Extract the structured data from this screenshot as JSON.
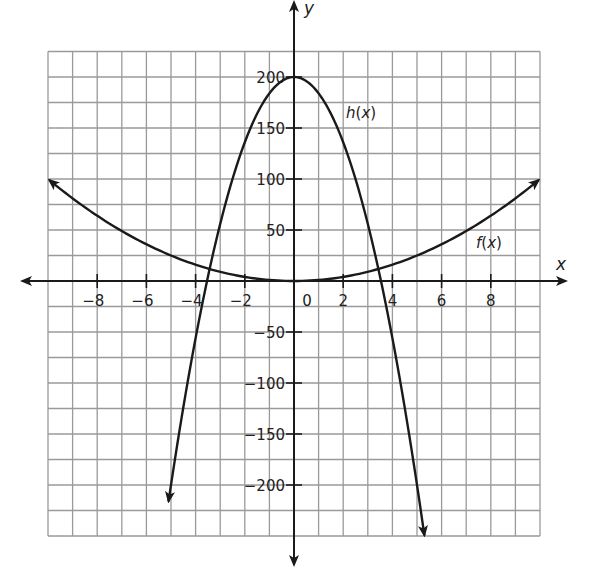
{
  "chart_data": {
    "type": "line",
    "title": "",
    "xlabel": "x",
    "ylabel": "y",
    "xlim": [
      -10,
      10
    ],
    "ylim": [
      -250,
      225
    ],
    "grid": true,
    "grid_x_step": 1,
    "grid_y_step": 25,
    "x_ticks": [
      -8,
      -6,
      -4,
      -2,
      0,
      2,
      4,
      6,
      8
    ],
    "x_tick_labels": [
      "−8",
      "−6",
      "−4",
      "−2",
      "0",
      "2",
      "4",
      "6",
      "8"
    ],
    "y_ticks": [
      200,
      150,
      100,
      50,
      -50,
      -100,
      -150,
      -200
    ],
    "y_tick_labels": [
      "200",
      "150",
      "100",
      "50",
      "−50",
      "−100",
      "−150",
      "−200"
    ],
    "series": [
      {
        "name": "f(x)",
        "label": "f(x)",
        "formula_estimate": "x^2",
        "x": [
          -10,
          -8,
          -6,
          -4,
          -2,
          0,
          2,
          4,
          6,
          8,
          10
        ],
        "values": [
          100,
          64,
          36,
          16,
          4,
          0,
          4,
          16,
          36,
          64,
          100
        ],
        "arrows": "both ends"
      },
      {
        "name": "h(x)",
        "label": "h(x)",
        "formula_estimate": "200 - 16x^2",
        "x": [
          -5.1,
          -4,
          -3,
          -2,
          -1,
          0,
          1,
          2,
          3,
          4,
          5.3
        ],
        "values": [
          -216,
          -56,
          56,
          136,
          184,
          200,
          184,
          136,
          56,
          -56,
          -249
        ],
        "arrows": "both ends"
      }
    ],
    "annotations": [
      {
        "text": "h(x)",
        "near": [
          2.2,
          165
        ]
      },
      {
        "text": "f(x)",
        "near": [
          7.5,
          25
        ]
      }
    ]
  },
  "labels": {
    "x_axis": "x",
    "y_axis": "y",
    "h_label_fn": "h",
    "h_label_arg": "x",
    "f_label_fn": "f",
    "f_label_arg": "x"
  },
  "colors": {
    "grid": "#9a9a9a",
    "axis": "#1a1a1a",
    "curve": "#1a1a1a",
    "background": "#ffffff"
  }
}
